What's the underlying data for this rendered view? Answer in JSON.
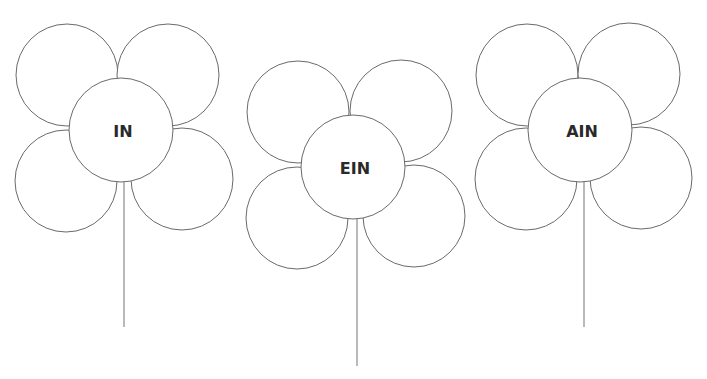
{
  "flowers": [
    {
      "label": "IN",
      "center": {
        "cx": 121,
        "cy": 130,
        "r": 52
      },
      "petals": [
        {
          "cx": 67,
          "cy": 75,
          "r": 51
        },
        {
          "cx": 168,
          "cy": 75,
          "r": 51
        },
        {
          "cx": 66,
          "cy": 181,
          "r": 51
        },
        {
          "cx": 182,
          "cy": 179,
          "r": 51
        }
      ],
      "stem": {
        "x": 124,
        "y1": 182,
        "y2": 327
      }
    },
    {
      "label": "EIN",
      "center": {
        "cx": 353,
        "cy": 167,
        "r": 52
      },
      "petals": [
        {
          "cx": 298,
          "cy": 112,
          "r": 51
        },
        {
          "cx": 401,
          "cy": 111,
          "r": 51
        },
        {
          "cx": 297,
          "cy": 218,
          "r": 51
        },
        {
          "cx": 414,
          "cy": 216,
          "r": 51
        }
      ],
      "stem": {
        "x": 357,
        "y1": 219,
        "y2": 366
      }
    },
    {
      "label": "AIN",
      "center": {
        "cx": 580,
        "cy": 130,
        "r": 52
      },
      "petals": [
        {
          "cx": 527,
          "cy": 75,
          "r": 51
        },
        {
          "cx": 629,
          "cy": 74,
          "r": 51
        },
        {
          "cx": 526,
          "cy": 179,
          "r": 51
        },
        {
          "cx": 641,
          "cy": 178,
          "r": 51
        }
      ],
      "stem": {
        "x": 584,
        "y1": 182,
        "y2": 327
      }
    }
  ],
  "colors": {
    "stroke": "#6a6a6a",
    "stem": "#8a8a8a",
    "text": "#2a2a2a",
    "background": "#ffffff"
  }
}
